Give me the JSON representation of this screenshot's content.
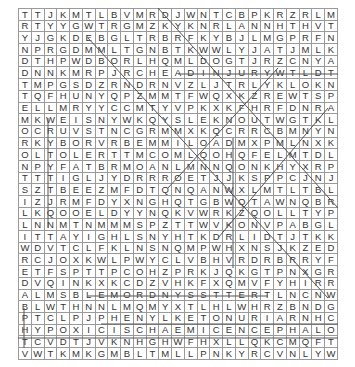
{
  "puzzle": {
    "type": "word-search",
    "columns": 25,
    "rows": [
      "TTJKMTLBVMRDJWNTCBPKRZRLMCKDKL",
      "RTYYGWTRGMZKYKNRLANNHTHVTMRJJV",
      "YJGKDEBGLTRBRFKYBJLMGPRFNTXNHB",
      "NPRGDMMLTGNBTKWWLYJATJMLKNXNVM",
      "DTHPWDBORLHQMLDOGTJRZCNYARGTYRN",
      "DNNKMRPJRCHEADINJURYWTLDTPKLNL",
      "TMPGSDZRNDRNVZLJTRLYKLOKNWNNRB",
      "TQFHUNYQPZMMTFWQXKZREWTSPGGTJR",
      "ELLMRYYCCMTYVPKXKFHRFDNRATRMNM",
      "MKWEISNYWKQYSLEKNOUTWGTKLECCPR",
      "OCRUVSTNCGRMMXKQCRRCBMNYNCMMJJ",
      "RKYBORVRBEMMILOADMXPMLNXKWVQLLR",
      "OLTOLERTTMCOMLQOHQFELMTDLRBLRAB",
      "NPYFATBRMOANLMNNQONKHYXRPHPPHKMT",
      "TTTIGLJYDRRROETJJKSPPCJNJVTYHJN",
      "SZTBEEZMFDTQNQANWXLMTLTBLJRFMR",
      "IZJRMFDYXNGHQTGBWQTAWNQBRRCWPW",
      "LKQOOELDYYNQKVWRKZQOLLTYPHCVLR",
      "LNNMTNMMMSPZTTWVKONVPABGLWLMTK",
      "ITTAYIGHLSNYHTKDRLIDTJTKKTYDZM",
      "WDVTCLFKLNSNQMPWHXNSJKZEDTCTNM",
      "RCJOXKWLPWYCLVBHVRDRBRRYFTARLJ",
      "ETFSPTTPCOHZPRKJQKGTPNXGROETVC",
      "DVQINKXKCDZVHKFXQMVFYHIRRQMNVC",
      "ALMSBLEMORDNYSSTTERTLNCNWHIVWK",
      "BLWTHNNLMQMYXTLHLWHRZBNDGKAWJB",
      "PTCLPJPHENYLKETONURIARNHCYBNRY",
      "HYPOXICISCHAEMICENCEPHALOPATHY",
      "TCVDTJVKNHGHWFHXLLQKCMQFTWVTZD",
      "VWTKMKGMBLTMLLPNKYRCVNLYWQTQMV"
    ],
    "highlighted_words": [
      "HEADINJURY",
      "MORDNYSSTTER",
      "PHENYLKETONURIA",
      "HYPOXICISCHAEMICENCEPHALOPATHY"
    ],
    "colors": {
      "grid_line": "#9a9a9a",
      "letter": "#333333",
      "strike_line": "#555555"
    }
  }
}
